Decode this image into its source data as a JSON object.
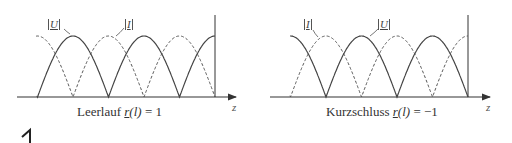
{
  "figure": {
    "panels": [
      {
        "id": "leerlauf",
        "caption_prefix": "Leerlauf ",
        "caption_r": "r",
        "caption_arg": "(l)",
        "caption_value": " = 1",
        "axis_label": "z",
        "labels": {
          "U": "U",
          "I": "I"
        },
        "U_shape": "sin",
        "I_shape": "cos"
      },
      {
        "id": "kurzschluss",
        "caption_prefix": "Kurzschluss ",
        "caption_r": "r",
        "caption_arg": "(l)",
        "caption_value": " = −1",
        "axis_label": "z",
        "labels": {
          "U": "U",
          "I": "I"
        },
        "U_shape": "cos",
        "I_shape": "sin"
      }
    ],
    "legend": {
      "solid": "|U|",
      "dashed": "|I|"
    },
    "corner_mark": "1"
  }
}
